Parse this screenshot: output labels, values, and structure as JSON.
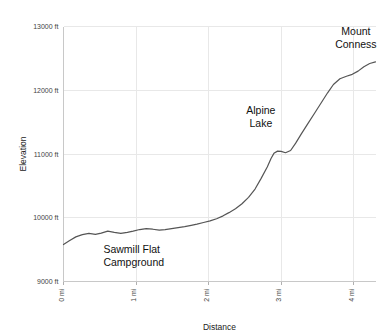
{
  "chart_data": {
    "type": "line",
    "title": "",
    "xlabel": "Distance",
    "ylabel": "Elevation",
    "xlim": [
      0,
      4.3
    ],
    "ylim": [
      9000,
      13000
    ],
    "grid": true,
    "legend": "none",
    "x_tick_labels": [
      "0 mi",
      "1 mi",
      "2 mi",
      "3 mi",
      "4 mi"
    ],
    "x_tick_values": [
      0,
      1,
      2,
      3,
      4
    ],
    "y_tick_labels": [
      "9000 ft",
      "10000 ft",
      "11000 ft",
      "12000 ft",
      "13000 ft"
    ],
    "y_tick_values": [
      9000,
      10000,
      11000,
      12000,
      13000
    ],
    "x_unit": "mi",
    "y_unit": "ft",
    "series": [
      {
        "name": "Elevation profile",
        "color": "#555555",
        "x": [
          0.0,
          0.08,
          0.17,
          0.26,
          0.35,
          0.44,
          0.52,
          0.61,
          0.7,
          0.79,
          0.88,
          0.96,
          1.05,
          1.14,
          1.23,
          1.32,
          1.4,
          1.49,
          1.58,
          1.67,
          1.76,
          1.84,
          1.93,
          2.02,
          2.11,
          2.2,
          2.28,
          2.37,
          2.46,
          2.55,
          2.64,
          2.72,
          2.81,
          2.86,
          2.9,
          2.95,
          3.0,
          3.06,
          3.13,
          3.2,
          3.28,
          3.37,
          3.46,
          3.55,
          3.64,
          3.72,
          3.81,
          3.9,
          3.98,
          4.06,
          4.14,
          4.22,
          4.3
        ],
        "y": [
          9580,
          9640,
          9700,
          9735,
          9755,
          9740,
          9760,
          9790,
          9770,
          9755,
          9770,
          9790,
          9815,
          9830,
          9820,
          9805,
          9815,
          9830,
          9845,
          9860,
          9880,
          9900,
          9925,
          9950,
          9985,
          10030,
          10080,
          10140,
          10220,
          10320,
          10450,
          10610,
          10800,
          10930,
          11010,
          11045,
          11040,
          11020,
          11055,
          11170,
          11320,
          11480,
          11640,
          11800,
          11960,
          12090,
          12180,
          12220,
          12250,
          12300,
          12370,
          12420,
          12445
        ]
      }
    ],
    "annotations": [
      {
        "label_lines": [
          "Sawmill Flat",
          "Campground"
        ],
        "x_mi": 0.55,
        "y_ft": 9450,
        "anchor": "start"
      },
      {
        "label_lines": [
          "Alpine",
          "Lake"
        ],
        "x_mi": 2.72,
        "y_ft": 11620,
        "anchor": "middle"
      },
      {
        "label_lines": [
          "Mount",
          "Conness"
        ],
        "x_mi": 4.03,
        "y_ft": 12870,
        "anchor": "middle"
      }
    ]
  }
}
